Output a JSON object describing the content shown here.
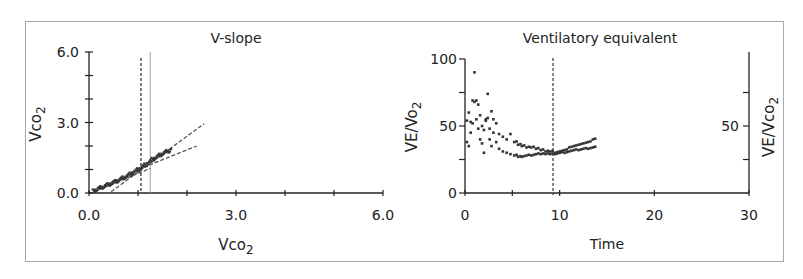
{
  "chart_data": [
    {
      "type": "scatter",
      "title": "V-slope",
      "xlabel": "Vco2",
      "ylabel": "Vco2",
      "xlim": [
        0,
        6
      ],
      "ylim": [
        0,
        6
      ],
      "x_ticks": [
        "0.0",
        "3.0",
        "6.0"
      ],
      "y_ticks": [
        "0.0",
        "3.0",
        "6.0"
      ],
      "grid": false,
      "annotations": [
        {
          "type": "vline",
          "style": "dashed",
          "x": 1.06
        },
        {
          "type": "vline",
          "style": "solid-thin",
          "x": 1.25
        },
        {
          "type": "regression",
          "style": "dashed",
          "from": [
            0.1,
            0.05
          ],
          "to": [
            1.25,
            1.05
          ]
        },
        {
          "type": "regression",
          "style": "dashed",
          "from": [
            0.45,
            0.05
          ],
          "to": [
            2.35,
            2.95
          ]
        },
        {
          "type": "regression",
          "style": "dashed",
          "from": [
            1.0,
            1.0
          ],
          "to": [
            2.2,
            2.0
          ]
        }
      ],
      "series": [
        {
          "name": "breath-by-breath",
          "x": [
            0.1,
            0.15,
            0.2,
            0.25,
            0.3,
            0.35,
            0.4,
            0.45,
            0.5,
            0.55,
            0.6,
            0.65,
            0.7,
            0.75,
            0.8,
            0.85,
            0.9,
            0.95,
            1.0,
            1.05,
            1.1,
            1.15,
            1.2,
            1.25,
            1.3,
            1.35,
            1.4,
            1.45,
            1.5,
            1.55,
            1.6,
            1.65
          ],
          "y": [
            0.1,
            0.15,
            0.2,
            0.24,
            0.28,
            0.33,
            0.37,
            0.41,
            0.45,
            0.5,
            0.55,
            0.6,
            0.65,
            0.7,
            0.76,
            0.82,
            0.88,
            0.94,
            1.0,
            1.06,
            1.13,
            1.2,
            1.28,
            1.36,
            1.44,
            1.5,
            1.56,
            1.62,
            1.68,
            1.73,
            1.78,
            1.82
          ]
        }
      ]
    },
    {
      "type": "scatter",
      "title": "Ventilatory equivalent",
      "xlabel": "Time",
      "ylabel": "VE/Vo2",
      "ylabel_right": "VE/Vco2",
      "xlim": [
        0,
        30
      ],
      "ylim": [
        0,
        100
      ],
      "x_ticks": [
        "0",
        "10",
        "20",
        "30"
      ],
      "y_ticks": [
        "0",
        "50",
        "100"
      ],
      "y_ticks_right": [
        "50"
      ],
      "grid": false,
      "annotations": [
        {
          "type": "vline",
          "style": "dashed",
          "x": 9.3
        }
      ],
      "series": [
        {
          "name": "VE/Vo2",
          "x": [
            0.2,
            0.4,
            0.6,
            0.8,
            1.0,
            1.2,
            1.4,
            1.6,
            1.8,
            2.0,
            2.2,
            2.4,
            2.6,
            2.8,
            3.0,
            3.3,
            3.6,
            4.0,
            4.4,
            4.8,
            5.2,
            5.6,
            6.0,
            6.5,
            7.0,
            7.5,
            8.0,
            8.5,
            9.0,
            9.5,
            10.0,
            10.5,
            11.0,
            11.5,
            12.0,
            12.5,
            13.0,
            13.5
          ],
          "y": [
            38,
            35,
            45,
            52,
            90,
            55,
            48,
            40,
            37,
            30,
            55,
            74,
            40,
            35,
            45,
            38,
            33,
            31,
            30,
            29,
            28,
            27,
            27,
            28,
            28,
            29,
            29,
            29,
            29,
            29,
            30,
            30,
            31,
            32,
            32,
            33,
            33,
            34
          ]
        },
        {
          "name": "VE/Vco2",
          "x": [
            0.2,
            0.4,
            0.6,
            0.8,
            1.0,
            1.2,
            1.4,
            1.6,
            1.8,
            2.0,
            2.2,
            2.4,
            2.6,
            2.8,
            3.0,
            3.3,
            3.6,
            4.0,
            4.4,
            4.8,
            5.2,
            5.6,
            6.0,
            6.5,
            7.0,
            7.5,
            8.0,
            8.5,
            9.0,
            9.5,
            10.0,
            10.5,
            11.0,
            11.5,
            12.0,
            12.5,
            13.0,
            13.5
          ],
          "y": [
            54,
            60,
            53,
            69,
            68,
            69,
            66,
            58,
            50,
            47,
            54,
            56,
            48,
            61,
            55,
            52,
            44,
            42,
            40,
            44,
            38,
            36,
            35,
            34,
            34,
            33,
            32,
            31,
            31,
            30,
            31,
            32,
            34,
            35,
            36,
            37,
            38,
            40
          ]
        }
      ]
    }
  ],
  "left_chart": {
    "title": "V-slope",
    "x_label": "Vco",
    "x_label_sub": "2",
    "y_label": "Vco",
    "y_label_sub": "2",
    "x_ticks": [
      "0.0",
      "3.0",
      "6.0"
    ],
    "y_ticks": [
      "0.0",
      "3.0",
      "6.0"
    ]
  },
  "right_chart": {
    "title": "Ventilatory equivalent",
    "x_label": "Time",
    "y_label": "VE/Vo",
    "y_label_sub": "2",
    "y_label_right": "VE/Vco",
    "y_label_right_sub": "2",
    "x_ticks": [
      "0",
      "10",
      "20",
      "30"
    ],
    "y_ticks": [
      "0",
      "50",
      "100"
    ],
    "y_ticks_right": [
      "50"
    ]
  },
  "colors": {
    "axis": "#222222",
    "points": "#333333",
    "frame": "#a8a8a8",
    "thin_line": "#9a9a9a"
  }
}
